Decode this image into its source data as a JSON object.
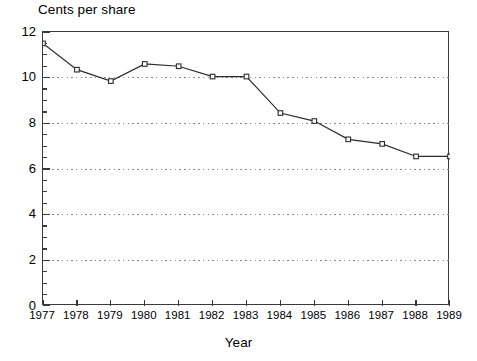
{
  "chart_data": {
    "type": "line",
    "title": "Cents per share",
    "xlabel": "Year",
    "ylabel": "",
    "categories": [
      "1977",
      "1978",
      "1979",
      "1980",
      "1981",
      "1982",
      "1983",
      "1984",
      "1985",
      "1986",
      "1987",
      "1988",
      "1989"
    ],
    "x": [
      1977,
      1978,
      1979,
      1980,
      1981,
      1982,
      1983,
      1984,
      1985,
      1986,
      1987,
      1988,
      1989
    ],
    "values": [
      11.5,
      10.35,
      9.85,
      10.6,
      10.5,
      10.05,
      10.05,
      8.45,
      8.1,
      7.3,
      7.1,
      6.55,
      6.55
    ],
    "series": [
      {
        "name": "Cents per share",
        "values": [
          11.5,
          10.35,
          9.85,
          10.6,
          10.5,
          10.05,
          10.05,
          8.45,
          8.1,
          7.3,
          7.1,
          6.55,
          6.55
        ]
      }
    ],
    "ylim": [
      0,
      12
    ],
    "xlim": [
      1977,
      1989
    ],
    "yticks": [
      0,
      2,
      4,
      6,
      8,
      10,
      12
    ],
    "ytick_labels": [
      "0",
      "2",
      "4",
      "6",
      "8",
      "10",
      "12"
    ],
    "y_minor_tick_step": 0.5,
    "xticks": [
      1977,
      1978,
      1979,
      1980,
      1981,
      1982,
      1983,
      1984,
      1985,
      1986,
      1987,
      1988,
      1989
    ],
    "grid": "horizontal-dotted-at-major-y",
    "legend": "none",
    "marker": "open-square",
    "line_color": "#2b2b2b",
    "marker_fill": "#ffffff",
    "grid_color": "#8a8a8a",
    "axis_color": "#3a3a3a",
    "background": "#ffffff"
  }
}
